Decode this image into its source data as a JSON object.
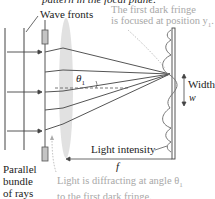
{
  "labels": {
    "top_cut": "pattern in the focal plane.",
    "wave_fronts": "Wave fronts",
    "fringe_note_line1": "The first dark fringe",
    "fringe_note_line2": "is focused at position y",
    "fringe_note_sub": "1",
    "fringe_note_end": ".",
    "theta": "θ",
    "theta_sub": "1",
    "width": "Width",
    "w": "w",
    "light_intensity": "Light intensity",
    "f": "f",
    "parallel_line1": "Parallel",
    "parallel_line2": "bundle",
    "parallel_line3": "of rays",
    "diffract_line1": "Light is diffracting at angle θ",
    "diffract_sub": "1",
    "diffract_line2": "to the first dark fringe."
  },
  "colors": {
    "ink": "#333333",
    "annotation_gray": "#a8a8a8",
    "lens": "#d9d9d9",
    "slit": "#bdbdbd"
  }
}
